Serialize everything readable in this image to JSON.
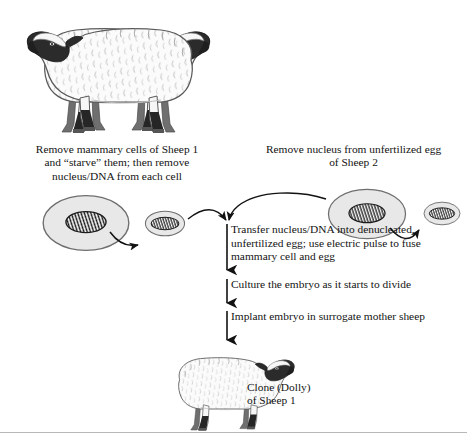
{
  "figure": {
    "background_color": "#ffffff",
    "text_color": "#131313"
  },
  "captions": {
    "sheep1": "Remove mammary cells of Sheep 1\nand “starve” them; then remove\nnucleus/DNA from each cell",
    "sheep2": "Remove nucleus from unfertilized egg\nof Sheep 2",
    "clone": "Clone (Dolly)\nof Sheep 1"
  },
  "steps": [
    {
      "id": "transfer",
      "text": "Transfer nucleus/DNA into denucleated,\nunfertilized egg; use electric pulse to fuse\nmammary cell and egg"
    },
    {
      "id": "culture",
      "text": "Culture the embryo as it starts to divide"
    },
    {
      "id": "implant",
      "text": "Implant embryo in surrogate mother sheep"
    }
  ],
  "sheep": [
    {
      "id": "sheep-1",
      "label": "Sheep 1",
      "facing": "right"
    },
    {
      "id": "sheep-2",
      "label": "Sheep 2",
      "facing": "left"
    },
    {
      "id": "clone-dolly",
      "label": "Clone (Dolly)",
      "facing": "right"
    }
  ],
  "cells": [
    {
      "id": "mammary-cell",
      "type": "cell-with-nucleus",
      "side": "left"
    },
    {
      "id": "extracted-mammary-nucleus",
      "type": "nucleus",
      "side": "left"
    },
    {
      "id": "egg-cell",
      "type": "cell-with-nucleus",
      "side": "right"
    },
    {
      "id": "extracted-egg-nucleus",
      "type": "nucleus",
      "side": "right"
    }
  ],
  "colors": {
    "cell_fill": "#e8e8e8",
    "cell_stroke": "#6e6e6e",
    "nucleus_fill": "#fbfbfb",
    "nucleus_stroke": "#1c1c1c",
    "chromatin": "#181818",
    "wool_fill": "#fbfbfb",
    "wool_stroke": "#5a5a5a",
    "dark_markings": "#2b2b2b",
    "arrow": "#121212",
    "frame_border": "#b8b8b8"
  },
  "arrows": [
    {
      "id": "arrow-mammary-to-nucleus",
      "direction": "right-down"
    },
    {
      "id": "arrow-nucleus-to-transfer",
      "direction": "right-down-curve"
    },
    {
      "id": "arrow-egg-to-transfer",
      "direction": "left-down-curve"
    },
    {
      "id": "arrow-egg-to-extracted-nucleus",
      "direction": "right-down"
    },
    {
      "id": "arrow-step-transfer",
      "direction": "down"
    },
    {
      "id": "arrow-step-culture",
      "direction": "down"
    },
    {
      "id": "arrow-step-implant",
      "direction": "down"
    }
  ]
}
